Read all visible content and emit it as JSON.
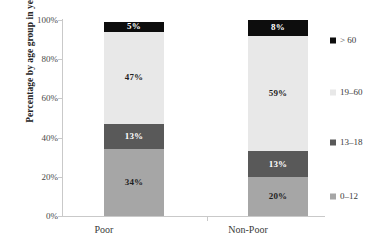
{
  "chart_data": {
    "type": "bar",
    "subtype": "stacked-bar-100-percent",
    "title": "",
    "xlabel": "",
    "ylabel": "Percentage by age group in years",
    "ylim": [
      0,
      100
    ],
    "ytick_labels": [
      "0%",
      "20%",
      "40%",
      "60%",
      "80%",
      "100%"
    ],
    "ytick_values": [
      0,
      20,
      40,
      60,
      80,
      100
    ],
    "grid": false,
    "legend_position": "right",
    "categories": [
      "Poor",
      "Non-Poor"
    ],
    "series": [
      {
        "name": "0–12",
        "values": [
          34,
          20
        ],
        "color": "#A6A6A6",
        "label_style": "on-light"
      },
      {
        "name": "13–18",
        "values": [
          13,
          13
        ],
        "color": "#595959",
        "label_style": "on-dark"
      },
      {
        "name": "19–60",
        "values": [
          47,
          59
        ],
        "color": "#E8E8E8",
        "label_style": "on-light"
      },
      {
        "name": "> 60",
        "values": [
          5,
          8
        ],
        "color": "#0D0D0D",
        "label_style": "on-dark"
      }
    ],
    "data_labels": {
      "Poor": [
        "34%",
        "13%",
        "47%",
        "5%"
      ],
      "Non-Poor": [
        "20%",
        "13%",
        "59%",
        "8%"
      ]
    },
    "legend_entries": [
      {
        "label": "> 60",
        "color": "#0D0D0D",
        "y": 40
      },
      {
        "label": "19–60",
        "color": "#E8E8E8",
        "y": 92
      },
      {
        "label": "13–18",
        "color": "#595959",
        "y": 142
      },
      {
        "label": "0–12",
        "color": "#A6A6A6",
        "y": 196
      }
    ]
  }
}
